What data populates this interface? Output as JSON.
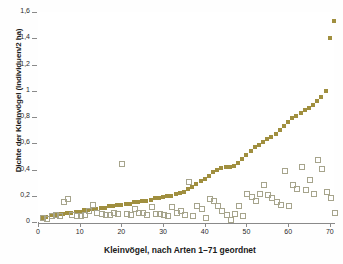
{
  "chart_data": {
    "type": "scatter",
    "title": "",
    "xlabel": "Kleinvögel, nach Arten 1–71 geordnet",
    "ylabel": "Dichte der Kleinvögel (Individuen/2 ha)",
    "xlim": [
      0,
      71
    ],
    "ylim": [
      0,
      1.6
    ],
    "xticks": [
      0,
      10,
      20,
      30,
      40,
      50,
      60,
      70
    ],
    "xtick_labels": [
      "0",
      "10",
      "20",
      "30",
      "40",
      "50",
      "60",
      "70"
    ],
    "yticks": [
      0,
      0.2,
      0.4,
      0.6,
      0.8,
      1.0,
      1.2,
      1.4,
      1.6
    ],
    "ytick_labels": [
      "0",
      "0,2",
      "0,4",
      "0,6",
      "0,8",
      "1",
      "1,2",
      "1,4",
      "1,6"
    ],
    "grid": false,
    "legend": "none",
    "colors": {
      "filled_marker": "#a08f3f",
      "open_marker_edge": "#a6a48c",
      "axis": "#8a8a8a",
      "text": "#1a1a1a",
      "background": "#ffffff"
    },
    "series": [
      {
        "name": "sortiert (gefüllte Quadrate)",
        "marker": "filled-square",
        "x": [
          1,
          2,
          3,
          4,
          5,
          6,
          7,
          8,
          9,
          10,
          11,
          12,
          13,
          14,
          15,
          16,
          17,
          18,
          19,
          20,
          21,
          22,
          23,
          24,
          25,
          26,
          27,
          28,
          29,
          30,
          31,
          32,
          33,
          34,
          35,
          36,
          37,
          38,
          39,
          40,
          41,
          42,
          43,
          44,
          45,
          46,
          47,
          48,
          49,
          50,
          51,
          52,
          53,
          54,
          55,
          56,
          57,
          58,
          59,
          60,
          61,
          62,
          63,
          64,
          65,
          66,
          67,
          68,
          69,
          70,
          71
        ],
        "values": [
          0.03,
          0.04,
          0.05,
          0.05,
          0.06,
          0.06,
          0.07,
          0.07,
          0.08,
          0.08,
          0.09,
          0.09,
          0.1,
          0.1,
          0.11,
          0.11,
          0.12,
          0.12,
          0.13,
          0.13,
          0.14,
          0.14,
          0.15,
          0.15,
          0.16,
          0.16,
          0.17,
          0.18,
          0.18,
          0.19,
          0.2,
          0.2,
          0.21,
          0.22,
          0.23,
          0.25,
          0.27,
          0.29,
          0.31,
          0.33,
          0.35,
          0.38,
          0.4,
          0.41,
          0.42,
          0.42,
          0.43,
          0.45,
          0.48,
          0.51,
          0.54,
          0.57,
          0.59,
          0.61,
          0.63,
          0.65,
          0.67,
          0.7,
          0.73,
          0.76,
          0.79,
          0.81,
          0.83,
          0.85,
          0.87,
          0.89,
          0.92,
          0.95,
          1.0,
          1.4,
          1.53
        ]
      },
      {
        "name": "unsortiert (offene Quadrate)",
        "marker": "open-square",
        "x": [
          1,
          2,
          3,
          4,
          5,
          6,
          7,
          8,
          9,
          10,
          11,
          12,
          13,
          14,
          15,
          16,
          17,
          18,
          19,
          20,
          21,
          22,
          23,
          24,
          25,
          26,
          27,
          28,
          29,
          30,
          31,
          32,
          33,
          34,
          35,
          36,
          37,
          38,
          39,
          40,
          41,
          42,
          43,
          44,
          45,
          46,
          47,
          48,
          49,
          50,
          51,
          52,
          53,
          54,
          55,
          56,
          57,
          58,
          59,
          60,
          61,
          62,
          63,
          64,
          65,
          66,
          67,
          68,
          69,
          70,
          71
        ],
        "values": [
          0.04,
          0.03,
          0.05,
          0.06,
          0.05,
          0.16,
          0.18,
          0.06,
          0.05,
          0.05,
          0.06,
          0.09,
          0.14,
          0.08,
          0.07,
          0.06,
          0.06,
          0.08,
          0.07,
          0.45,
          0.07,
          0.06,
          0.11,
          0.08,
          0.08,
          0.06,
          0.12,
          0.07,
          0.07,
          0.06,
          0.05,
          0.12,
          0.08,
          0.09,
          0.06,
          0.31,
          0.05,
          0.13,
          0.11,
          0.04,
          0.18,
          0.17,
          0.13,
          0.09,
          0.06,
          0.02,
          0.07,
          0.13,
          0.05,
          0.22,
          0.2,
          0.17,
          0.22,
          0.29,
          0.21,
          0.19,
          0.16,
          0.14,
          0.4,
          0.13,
          0.29,
          0.26,
          0.43,
          0.25,
          0.33,
          0.22,
          0.48,
          0.41,
          0.24,
          0.19,
          0.08
        ]
      }
    ]
  }
}
